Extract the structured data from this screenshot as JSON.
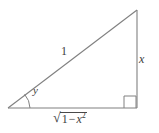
{
  "figure": {
    "name": "right-triangle-trig-diagram",
    "background_color": "#ffffff",
    "stroke_color": "#808080",
    "text_color": "#3d3d3d",
    "labels": {
      "hypotenuse": "1",
      "opposite_side": "x",
      "angle": "y",
      "adjacent_radical_sign": "√",
      "adjacent_radicand_one": "1",
      "adjacent_radicand_minus": "−",
      "adjacent_radicand_var": "x",
      "adjacent_radicand_exponent": "2"
    },
    "geometry": {
      "left_vertex": [
        8,
        108
      ],
      "right_vertex": [
        137,
        108
      ],
      "apex": [
        137,
        10
      ],
      "right_angle_marker": [
        124,
        96,
        12,
        12
      ],
      "angle_arc_radius": 22
    }
  }
}
